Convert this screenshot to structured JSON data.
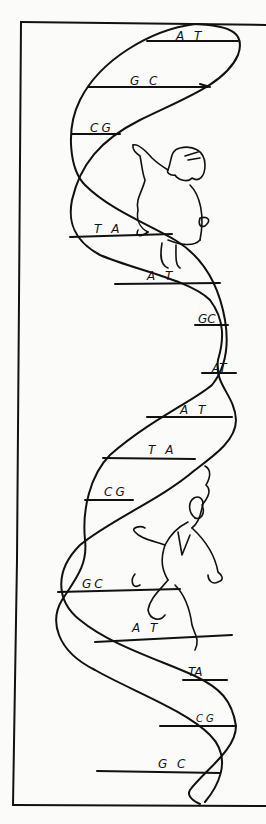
{
  "illustration": {
    "subject": "DNA double helix with two climbing figures",
    "ink_color": "#111111",
    "paper_color": "#fbfbfa"
  },
  "base_pairs": [
    {
      "label": "A T",
      "x": 176,
      "y": 30
    },
    {
      "label": "G C",
      "x": 130,
      "y": 75
    },
    {
      "label": "CG",
      "x": 90,
      "y": 122
    },
    {
      "label": "T A",
      "x": 94,
      "y": 223
    },
    {
      "label": "A T",
      "x": 147,
      "y": 270
    },
    {
      "label": "GC",
      "x": 198,
      "y": 313
    },
    {
      "label": "AT",
      "x": 212,
      "y": 362
    },
    {
      "label": "A T",
      "x": 180,
      "y": 404
    },
    {
      "label": "T A",
      "x": 148,
      "y": 444
    },
    {
      "label": "CG",
      "x": 104,
      "y": 486
    },
    {
      "label": "GC",
      "x": 82,
      "y": 578
    },
    {
      "label": "A T",
      "x": 132,
      "y": 622
    },
    {
      "label": "TA",
      "x": 188,
      "y": 666
    },
    {
      "label": "CG",
      "x": 196,
      "y": 714
    },
    {
      "label": "G C",
      "x": 158,
      "y": 758
    }
  ],
  "figures": [
    {
      "name": "upper-figure",
      "description": "man pointing upward"
    },
    {
      "name": "lower-figure",
      "description": "man with wild hair"
    }
  ]
}
